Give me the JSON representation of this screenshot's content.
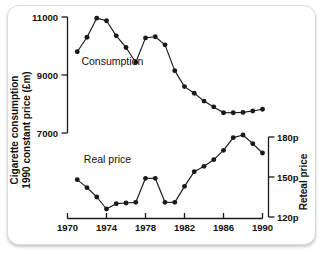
{
  "chart_data": {
    "type": "line",
    "title": "",
    "subtitle": "",
    "xlabel": "",
    "ylabel": "Cigarette consumption 1990 constant price (£m)",
    "y2label": "Reteal price",
    "xlim": [
      1970,
      1990
    ],
    "ylim": [
      7000,
      11000
    ],
    "y2lim": [
      120,
      180
    ],
    "grid": false,
    "legend": "inline-annotations",
    "xticks": [
      "1970",
      "1974",
      "1978",
      "1982",
      "1986",
      "1990"
    ],
    "xtick_values": [
      1970,
      1974,
      1978,
      1982,
      1986,
      1990
    ],
    "yticks": [
      "11000",
      "9000",
      "7000"
    ],
    "ytick_values": [
      11000,
      9000,
      7000
    ],
    "y2ticks": [
      "180p",
      "150p",
      "120p"
    ],
    "y2tick_values": [
      180,
      150,
      120
    ],
    "x": [
      1971,
      1972,
      1973,
      1974,
      1975,
      1976,
      1977,
      1978,
      1979,
      1980,
      1981,
      1982,
      1983,
      1984,
      1985,
      1986,
      1987,
      1988,
      1989,
      1990
    ],
    "series": [
      {
        "name": "Consumption",
        "axis": "left",
        "units": "£m",
        "label_x": 1974.6,
        "label_y": 9330,
        "values": [
          9800,
          10300,
          10960,
          10870,
          10350,
          9950,
          9430,
          10280,
          10320,
          10040,
          9150,
          8600,
          8370,
          8100,
          7900,
          7700,
          7700,
          7710,
          7760,
          7820
        ]
      },
      {
        "name": "Real price",
        "axis": "right",
        "units": "p",
        "label_x": 1974.1,
        "label_y": 160.5,
        "values": [
          148,
          142,
          135,
          126,
          130,
          130.5,
          131,
          149,
          149,
          131,
          131,
          143,
          154,
          158,
          163,
          170,
          179.5,
          181.5,
          175,
          168
        ]
      }
    ]
  },
  "axes": {
    "left_axis_name": "cigarette-consumption-axis",
    "right_axis_name": "retail-price-axis",
    "bottom_axis_name": "year-axis"
  }
}
